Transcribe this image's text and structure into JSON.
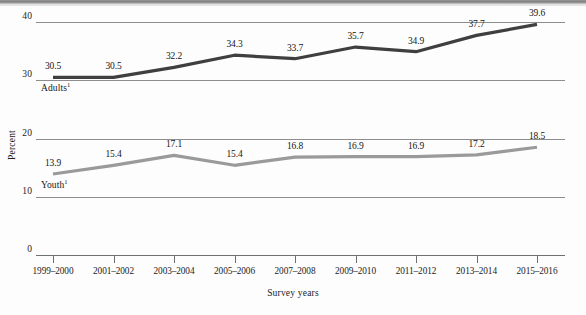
{
  "chart_data": {
    "type": "line",
    "title": "",
    "xlabel": "Survey years",
    "ylabel": "Percent",
    "ylim": [
      0,
      40
    ],
    "yticks": [
      "0",
      "10",
      "20",
      "30",
      "40"
    ],
    "grid": true,
    "legend_position": "inline-labels",
    "categories": [
      "1999–2000",
      "2001–2002",
      "2003–2004",
      "2005–2006",
      "2007–2008",
      "2009–2010",
      "2011–2012",
      "2013–2014",
      "2015–2016"
    ],
    "series": [
      {
        "name": "Adults",
        "footnote_marker": "1",
        "color": "#3f3f3f",
        "values": [
          30.5,
          30.5,
          32.2,
          34.3,
          33.7,
          35.7,
          34.9,
          37.7,
          39.6
        ],
        "labels": [
          "30.5",
          "30.5",
          "32.2",
          "34.3",
          "33.7",
          "35.7",
          "34.9",
          "37.7",
          "39.6"
        ]
      },
      {
        "name": "Youth",
        "footnote_marker": "1",
        "color": "#9a9a9a",
        "values": [
          13.9,
          15.4,
          17.1,
          15.4,
          16.8,
          16.9,
          16.9,
          17.2,
          18.5
        ],
        "labels": [
          "13.9",
          "15.4",
          "17.1",
          "15.4",
          "16.8",
          "16.9",
          "16.9",
          "17.2",
          "18.5"
        ]
      }
    ]
  }
}
